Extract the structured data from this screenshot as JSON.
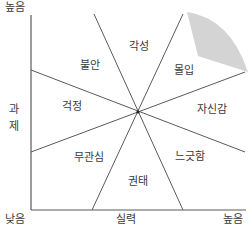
{
  "axes": {
    "y_label": [
      "과",
      "제"
    ],
    "y_high": "높음",
    "x_label": "실력",
    "x_low_origin": "낮음",
    "x_high": "높음"
  },
  "regions": [
    {
      "key": "arousal",
      "label": "각성"
    },
    {
      "key": "flow",
      "label": "몰입"
    },
    {
      "key": "control",
      "label": "자신감"
    },
    {
      "key": "relaxation",
      "label": "느긋함"
    },
    {
      "key": "boredom",
      "label": "권태"
    },
    {
      "key": "apathy",
      "label": "무관심"
    },
    {
      "key": "worry",
      "label": "걱정"
    },
    {
      "key": "anxiety",
      "label": "불안"
    }
  ],
  "colors": {
    "line": "#5a5a5a",
    "flow_highlight": "#d4d4d4",
    "text": "#3a3a3a"
  }
}
